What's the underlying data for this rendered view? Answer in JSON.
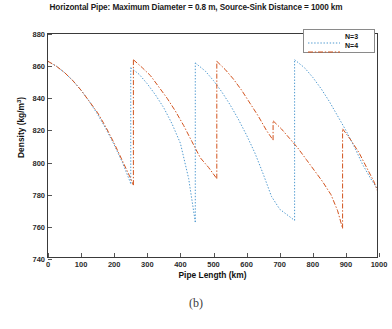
{
  "chart_data": {
    "type": "line",
    "title": "Horizontal Pipe: Maximum Diameter = 0.8 m, Source-Sink Distance = 1000 km",
    "xlabel": "Pipe Length (km)",
    "ylabel_text": "Density (kg/m",
    "ylabel_sup": "3",
    "ylabel_tail": ")",
    "ylabel_full": "Density (kg/m3)",
    "xlim": [
      0,
      1000
    ],
    "ylim": [
      740,
      880
    ],
    "xticks": [
      0,
      100,
      200,
      300,
      400,
      500,
      600,
      700,
      800,
      900,
      1000
    ],
    "yticks": [
      740,
      760,
      780,
      800,
      820,
      840,
      860,
      880
    ],
    "grid": false,
    "legend_position": "top-right",
    "series": [
      {
        "name": "N=3",
        "color": "#4f9ad0",
        "style": "dotted",
        "segments": [
          [
            [
              0,
              863
            ],
            [
              25,
              860
            ],
            [
              50,
              856
            ],
            [
              75,
              851
            ],
            [
              100,
              845
            ],
            [
              125,
              838
            ],
            [
              150,
              830
            ],
            [
              175,
              821
            ],
            [
              200,
              811
            ],
            [
              225,
              800
            ],
            [
              250,
              787
            ]
          ],
          [
            [
              250,
              859
            ],
            [
              275,
              855
            ],
            [
              300,
              849
            ],
            [
              325,
              842
            ],
            [
              350,
              834
            ],
            [
              375,
              824
            ],
            [
              400,
              812
            ],
            [
              425,
              790
            ],
            [
              445,
              763
            ]
          ],
          [
            [
              445,
              862
            ],
            [
              475,
              857
            ],
            [
              500,
              851
            ],
            [
              525,
              844
            ],
            [
              550,
              836
            ],
            [
              575,
              827
            ],
            [
              600,
              817
            ],
            [
              625,
              806
            ],
            [
              650,
              793
            ],
            [
              675,
              779
            ],
            [
              700,
              771
            ],
            [
              745,
              764
            ]
          ],
          [
            [
              745,
              864
            ],
            [
              775,
              859
            ],
            [
              800,
              853
            ],
            [
              825,
              846
            ],
            [
              850,
              838
            ],
            [
              875,
              829
            ],
            [
              900,
              820
            ],
            [
              925,
              810
            ],
            [
              950,
              799
            ],
            [
              975,
              790
            ],
            [
              1000,
              782
            ]
          ]
        ]
      },
      {
        "name": "N=4",
        "color": "#d2541f",
        "style": "dash-dot",
        "segments": [
          [
            [
              0,
              863
            ],
            [
              25,
              860
            ],
            [
              50,
              856
            ],
            [
              75,
              851
            ],
            [
              100,
              845
            ],
            [
              125,
              838
            ],
            [
              150,
              831
            ],
            [
              175,
              822
            ],
            [
              200,
              812
            ],
            [
              225,
              801
            ],
            [
              250,
              790
            ],
            [
              258,
              786
            ]
          ],
          [
            [
              258,
              864
            ],
            [
              285,
              859
            ],
            [
              310,
              854
            ],
            [
              335,
              847
            ],
            [
              360,
              840
            ],
            [
              385,
              832
            ],
            [
              410,
              823
            ],
            [
              435,
              813
            ],
            [
              460,
              803
            ],
            [
              485,
              797
            ],
            [
              510,
              790
            ]
          ],
          [
            [
              510,
              863
            ],
            [
              535,
              858
            ],
            [
              560,
              852
            ],
            [
              585,
              845
            ],
            [
              610,
              837
            ],
            [
              635,
              829
            ],
            [
              660,
              820
            ],
            [
              680,
              814
            ]
          ],
          [
            [
              680,
              826
            ],
            [
              705,
              821
            ],
            [
              730,
              815
            ],
            [
              755,
              809
            ],
            [
              780,
              802
            ],
            [
              805,
              795
            ],
            [
              830,
              788
            ],
            [
              855,
              784
            ],
            [
              875,
              822
            ],
            [
              890,
              820
            ]
          ],
          [
            [
              890,
              821
            ],
            [
              915,
              814
            ],
            [
              940,
              805
            ],
            [
              960,
              790
            ],
            [
              890,
              759
            ]
          ]
        ],
        "segments_fixed": [
          [
            [
              0,
              863
            ],
            [
              25,
              860
            ],
            [
              50,
              856
            ],
            [
              75,
              851
            ],
            [
              100,
              845
            ],
            [
              125,
              838
            ],
            [
              150,
              831
            ],
            [
              175,
              822
            ],
            [
              200,
              812
            ],
            [
              225,
              801
            ],
            [
              250,
              790
            ],
            [
              258,
              786
            ]
          ],
          [
            [
              258,
              864
            ],
            [
              285,
              859
            ],
            [
              310,
              854
            ],
            [
              335,
              847
            ],
            [
              360,
              840
            ],
            [
              385,
              832
            ],
            [
              410,
              823
            ],
            [
              435,
              813
            ],
            [
              460,
              803
            ],
            [
              485,
              797
            ],
            [
              510,
              790
            ]
          ],
          [
            [
              510,
              863
            ],
            [
              535,
              858
            ],
            [
              560,
              852
            ],
            [
              585,
              845
            ],
            [
              610,
              837
            ],
            [
              635,
              829
            ],
            [
              660,
              820
            ],
            [
              680,
              814
            ]
          ],
          [
            [
              680,
              826
            ],
            [
              705,
              821
            ],
            [
              730,
              815
            ],
            [
              755,
              809
            ],
            [
              780,
              802
            ],
            [
              805,
              795
            ],
            [
              830,
              788
            ],
            [
              855,
              780
            ],
            [
              875,
              770
            ],
            [
              890,
              759
            ]
          ],
          [
            [
              890,
              821
            ],
            [
              915,
              814
            ],
            [
              940,
              806
            ],
            [
              965,
              796
            ],
            [
              985,
              788
            ],
            [
              1000,
              780
            ]
          ]
        ]
      }
    ],
    "legend": [
      {
        "label": "N=3",
        "color": "#4f9ad0",
        "style": "dotted"
      },
      {
        "label": "N=4",
        "color": "#d2541f",
        "style": "dash-dot"
      }
    ]
  },
  "caption": "(b)"
}
